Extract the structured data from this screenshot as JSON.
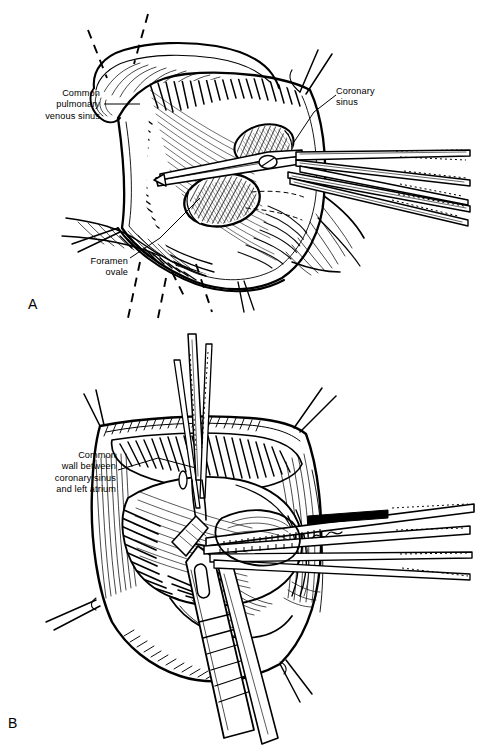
{
  "figure": {
    "background_color": "#ffffff",
    "ink_color": "#000000",
    "width": 480,
    "height": 750,
    "style": "pen-and-ink surgical line drawing",
    "panels": [
      {
        "letter": "A",
        "name": "panel-a",
        "description": "Opened left atrium / right atrium view with scissors dividing tissue",
        "labels": [
          {
            "name": "common-pulmonary-venous-sinus",
            "lines": [
              "Common",
              "pulmonary",
              "venous sinus"
            ],
            "text": "Common\npulmonary\nvenous sinus",
            "align": "right"
          },
          {
            "name": "coronary-sinus",
            "lines": [
              "Coronary",
              "sinus"
            ],
            "text": "Coronary\nsinus",
            "align": "left"
          },
          {
            "name": "foramen-ovale",
            "lines": [
              "Foramen",
              "ovale"
            ],
            "text": "Foramen\novale",
            "align": "right"
          }
        ],
        "instruments": [
          "surgical scissors",
          "forceps",
          "retractor tips"
        ]
      },
      {
        "letter": "B",
        "name": "panel-b",
        "description": "Atrial cavity held open by retractors with forceps grasping common wall",
        "labels": [
          {
            "name": "common-wall-between-coronary-sinus-and-left-atrium",
            "lines": [
              "Common",
              "wall between",
              "coronary sinus",
              "and left atrium"
            ],
            "text": "Common\nwall between\ncoronary sinus\nand left atrium",
            "align": "right"
          }
        ],
        "instruments": [
          "nerve hook",
          "ribbed retractor",
          "forceps",
          "suction tip"
        ]
      }
    ]
  },
  "caption": {
    "cut_off_line": "",
    "visible": false
  }
}
